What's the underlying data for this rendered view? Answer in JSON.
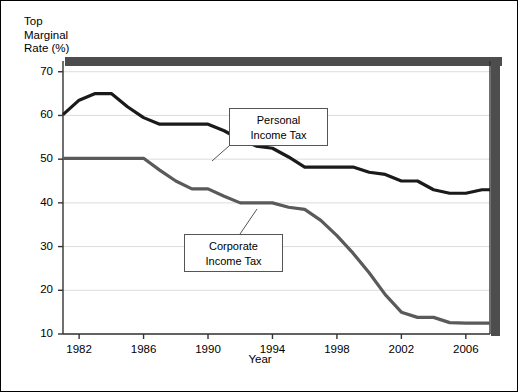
{
  "chart_data": {
    "type": "line",
    "title": "",
    "ylabel": "Top Marginal Rate (%)",
    "ylabel_lines": [
      "Top",
      "Marginal",
      "Rate (%)"
    ],
    "xlabel": "Year",
    "xlim": [
      1981,
      2007.5
    ],
    "ylim": [
      10,
      72
    ],
    "yticks": [
      10,
      20,
      30,
      40,
      50,
      60,
      70
    ],
    "xticks": [
      1982,
      1986,
      1990,
      1994,
      1998,
      2002,
      2006
    ],
    "grid": "horizontal",
    "legend_position": "inline-annotations",
    "series": [
      {
        "name": "Personal Income Tax",
        "color": "#1a1a1a",
        "width": 3.2,
        "x": [
          1981,
          1982,
          1983,
          1984,
          1985,
          1986,
          1987,
          1988,
          1989,
          1990,
          1991,
          1992,
          1993,
          1994,
          1995,
          1996,
          1997,
          1998,
          1999,
          2000,
          2001,
          2002,
          2003,
          2004,
          2005,
          2006,
          2007,
          2007.5
        ],
        "values": [
          60.2,
          63.5,
          65.0,
          65.0,
          62.0,
          59.5,
          58.0,
          58.0,
          58.0,
          58.0,
          56.5,
          54.5,
          53.0,
          52.5,
          50.5,
          48.2,
          48.2,
          48.2,
          48.2,
          47.0,
          46.5,
          45.0,
          45.0,
          43.0,
          42.2,
          42.2,
          43.0,
          43.0
        ]
      },
      {
        "name": "Corporate Income Tax",
        "color": "#5a5a5a",
        "width": 3.2,
        "x": [
          1981,
          1982,
          1983,
          1984,
          1985,
          1986,
          1987,
          1988,
          1989,
          1990,
          1991,
          1992,
          1993,
          1994,
          1995,
          1996,
          1997,
          1998,
          1999,
          2000,
          2001,
          2002,
          2003,
          2004,
          2005,
          2006,
          2007,
          2007.5
        ],
        "values": [
          50.2,
          50.2,
          50.2,
          50.2,
          50.2,
          50.2,
          47.5,
          45.0,
          43.2,
          43.2,
          41.5,
          40.0,
          40.0,
          40.0,
          39.0,
          38.5,
          36.0,
          32.5,
          28.5,
          24.0,
          19.0,
          15.0,
          13.8,
          13.8,
          12.6,
          12.5,
          12.5,
          12.5
        ]
      }
    ],
    "annotations": [
      {
        "id": "personal-note",
        "lines": [
          "Personal",
          "Income Tax"
        ],
        "box": {
          "left": 228,
          "top": 107,
          "width": 99,
          "height": 38
        },
        "leader": {
          "x1": 228,
          "y1": 145,
          "x2": 211,
          "y2": 160
        }
      },
      {
        "id": "corporate-note",
        "lines": [
          "Corporate",
          "Income Tax"
        ],
        "box": {
          "left": 183,
          "top": 233,
          "width": 99,
          "height": 38
        },
        "leader": {
          "x1": 239,
          "y1": 233,
          "x2": 256,
          "y2": 208
        }
      }
    ],
    "colors": {
      "personal": "#1a1a1a",
      "corporate": "#5a5a5a",
      "grid": "#dcdcdc",
      "axis": "#333333",
      "shadow": "#4d4d4d",
      "frame": "#000000"
    }
  },
  "axes": {
    "y_title_lines": [
      "Top",
      "Marginal",
      "Rate (%)"
    ],
    "x_title": "Year",
    "y_tick_labels": [
      "70",
      "60",
      "50",
      "40",
      "30",
      "20",
      "10"
    ],
    "x_tick_labels": [
      "1982",
      "1986",
      "1990",
      "1994",
      "1998",
      "2002",
      "2006"
    ]
  }
}
